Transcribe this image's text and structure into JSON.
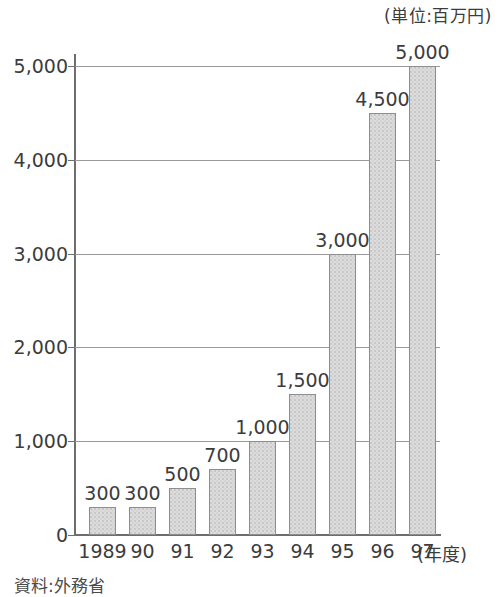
{
  "chart_data": {
    "type": "bar",
    "title": "",
    "unit_note": "(単位:百万円)",
    "categories": [
      "1989",
      "90",
      "91",
      "92",
      "93",
      "94",
      "95",
      "96",
      "97"
    ],
    "values": [
      300,
      300,
      500,
      700,
      1000,
      1500,
      3000,
      4500,
      5000
    ],
    "value_labels": [
      "300",
      "300",
      "500",
      "700",
      "1,000",
      "1,500",
      "3,000",
      "4,500",
      "5,000"
    ],
    "xlabel": "(年度)",
    "ylabel": "",
    "ylim": [
      0,
      5000
    ],
    "yticks": [
      0,
      1000,
      2000,
      3000,
      4000,
      5000
    ],
    "ytick_labels": [
      "0",
      "1,000",
      "2,000",
      "3,000",
      "4,000",
      "5,000"
    ],
    "grid": true,
    "legend": false,
    "source_note": "資料:外務省",
    "bar_fill_color": "#dcdcdc",
    "bar_border_color": "#8e8e8e",
    "gridline_color": "#9a9a9a",
    "axis_color": "#6e6e6e",
    "text_color": "#3c3c3c"
  }
}
